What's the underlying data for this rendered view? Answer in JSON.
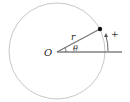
{
  "diagram": {
    "circle": {
      "cx": 57,
      "cy": 51,
      "r": 48,
      "stroke": "#c8c8c8"
    },
    "origin_label": "O",
    "radius_label": "r",
    "angle_label": "θ",
    "direction_label": "+",
    "line_color": "#444444",
    "point_color": "#111111"
  }
}
